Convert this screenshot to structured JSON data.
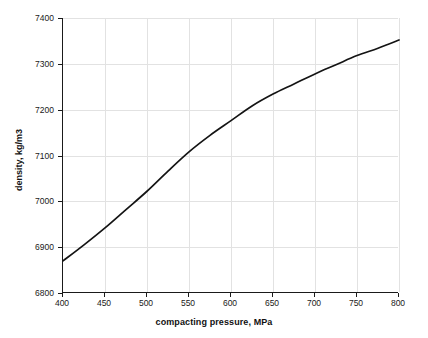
{
  "chart_data": {
    "type": "line",
    "title": "",
    "xlabel": "compacting pressure, MPa",
    "ylabel": "density, kg/m3",
    "xlim": [
      400,
      800
    ],
    "ylim": [
      6800,
      7400
    ],
    "xticks": [
      400,
      450,
      500,
      550,
      600,
      650,
      700,
      750,
      800
    ],
    "yticks": [
      6800,
      6900,
      7000,
      7100,
      7200,
      7300,
      7400
    ],
    "grid": true,
    "legend": null,
    "series": [
      {
        "name": "density vs compacting pressure",
        "color": "#141414",
        "x": [
          400,
          425,
          450,
          475,
          500,
          525,
          550,
          575,
          600,
          625,
          650,
          675,
          700,
          725,
          750,
          775,
          800
        ],
        "y": [
          6870,
          6905,
          6942,
          6982,
          7022,
          7066,
          7108,
          7144,
          7176,
          7208,
          7234,
          7256,
          7278,
          7298,
          7318,
          7334,
          7352
        ]
      }
    ]
  },
  "axis": {
    "x_tick_labels": [
      "400",
      "450",
      "500",
      "550",
      "600",
      "650",
      "700",
      "750",
      "800"
    ],
    "y_tick_labels": [
      "6800",
      "6900",
      "7000",
      "7100",
      "7200",
      "7300",
      "7400"
    ]
  }
}
